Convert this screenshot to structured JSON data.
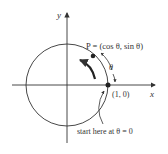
{
  "diagram": {
    "type": "unit-circle",
    "axes": {
      "x_label": "x",
      "y_label": "y"
    },
    "point_p": {
      "label": "P = (cos θ, sin θ)"
    },
    "start_point": {
      "label": "(1, 0)"
    },
    "angle_label": "θ",
    "annotation": "start here at θ = 0",
    "colors": {
      "stroke": "#333333",
      "background": "#ffffff"
    }
  }
}
